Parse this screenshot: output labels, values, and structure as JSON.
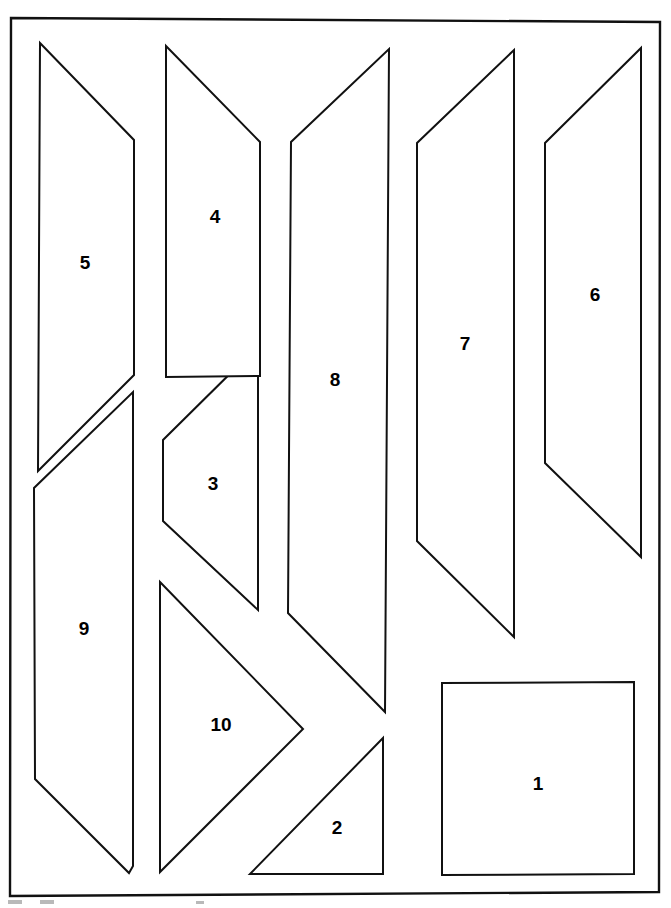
{
  "page": {
    "background_color": "#ffffff",
    "line_color": "#111111",
    "label_color": "#000000",
    "width": 671,
    "height": 908
  },
  "sheet_border": {
    "name": "sheet-border",
    "points": "11,18 660,22 659,892 10,896"
  },
  "bottom_marks": [
    {
      "name": "edge-mark-left",
      "x": 8,
      "y": 900,
      "w": 14,
      "h": 4
    },
    {
      "name": "edge-mark-second",
      "x": 40,
      "y": 900,
      "w": 14,
      "h": 4
    },
    {
      "name": "edge-mark-third",
      "x": 196,
      "y": 901,
      "w": 8,
      "h": 3
    }
  ],
  "pieces": [
    {
      "id": "piece-1",
      "label": "1",
      "shape": "square",
      "points": "442,683 634,682 634,874 442,875",
      "label_x": 538,
      "label_y": 785
    },
    {
      "id": "piece-2",
      "label": "2",
      "shape": "right-triangle",
      "points": "383,738 383,874 250,874",
      "label_x": 337,
      "label_y": 829
    },
    {
      "id": "piece-3",
      "label": "3",
      "shape": "pentagon",
      "points": "258,346 258,610 163,521 163,440",
      "label_x": 213,
      "label_y": 485
    },
    {
      "id": "piece-4",
      "label": "4",
      "shape": "quadrilateral",
      "points": "166,46 260,142 260,376 166,377",
      "label_x": 215,
      "label_y": 218
    },
    {
      "id": "piece-5",
      "label": "5",
      "shape": "quadrilateral",
      "points": "40,43 134,140 134,375 38,471",
      "label_x": 85,
      "label_y": 264
    },
    {
      "id": "piece-6",
      "label": "6",
      "shape": "quadrilateral",
      "points": "641,48 641,557 545,463 545,143",
      "label_x": 595,
      "label_y": 296
    },
    {
      "id": "piece-7",
      "label": "7",
      "shape": "quadrilateral",
      "points": "514,50 514,637 417,541 417,143",
      "label_x": 465,
      "label_y": 345
    },
    {
      "id": "piece-8",
      "label": "8",
      "shape": "quadrilateral",
      "points": "389,49 385,712 288,613 291,142",
      "label_x": 335,
      "label_y": 381
    },
    {
      "id": "piece-9",
      "label": "9",
      "shape": "quadrilateral",
      "points": "133,392 133,866 129,873 35,779 34,488",
      "label_x": 84,
      "label_y": 630
    },
    {
      "id": "piece-10",
      "label": "10",
      "shape": "triangle",
      "points": "160,582 303,729 160,872",
      "label_x": 221,
      "label_y": 726
    }
  ]
}
